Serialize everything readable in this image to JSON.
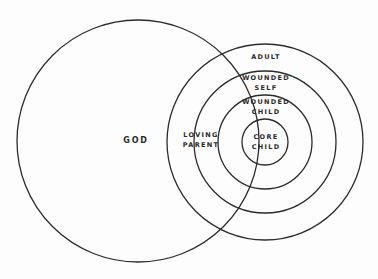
{
  "diagram": {
    "stroke_color": "#2b2b2b",
    "background": "#fdfdfd",
    "circles": [
      {
        "id": "god",
        "cx": 138,
        "cy": 141,
        "r": 121
      },
      {
        "id": "adult",
        "cx": 265,
        "cy": 142,
        "r": 98
      },
      {
        "id": "wounded-self",
        "cx": 265,
        "cy": 142,
        "r": 71
      },
      {
        "id": "wounded-child",
        "cx": 265,
        "cy": 142,
        "r": 47
      },
      {
        "id": "core-child",
        "cx": 265,
        "cy": 142,
        "r": 23
      }
    ],
    "labels": {
      "god": "GOD",
      "loving_parent_1": "LOVING",
      "loving_parent_2": "PARENT",
      "adult": "ADULT",
      "wounded_self_1": "WOUNDED",
      "wounded_self_2": "SELF",
      "wounded_child_1": "WOUNDED",
      "wounded_child_2": "CHILD",
      "core_child_1": "CORE",
      "core_child_2": "CHILD"
    }
  }
}
